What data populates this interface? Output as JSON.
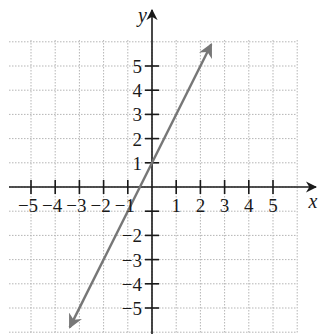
{
  "chart_data": {
    "type": "line",
    "title": "",
    "xlabel": "x",
    "ylabel": "y",
    "xlim": [
      -6,
      6
    ],
    "ylim": [
      -6,
      6
    ],
    "grid": true,
    "grid_style": "dotted",
    "x_ticks": [
      -5,
      -4,
      -3,
      -2,
      -1,
      1,
      2,
      3,
      4,
      5
    ],
    "y_ticks": [
      -5,
      -4,
      -3,
      -2,
      -1,
      1,
      2,
      3,
      4,
      5
    ],
    "x_tick_labels": [
      "−5",
      "−4",
      "−3",
      "−2",
      "−1",
      "1",
      "2",
      "3",
      "4",
      "5"
    ],
    "y_tick_labels": [
      "−5",
      "−4",
      "−3",
      "−2",
      "−1",
      "1",
      "2",
      "3",
      "4",
      "5"
    ],
    "series": [
      {
        "name": "y = 2x + 1",
        "equation": "y = 2x + 1",
        "slope": 2,
        "intercept": 1,
        "x": [
          -3.4,
          2.45
        ],
        "y": [
          -5.8,
          5.9
        ],
        "arrows": "both",
        "color": "#777777"
      }
    ],
    "legend": null
  },
  "colors": {
    "axis": "#1a1a1a",
    "grid": "#b5b5b5",
    "line": "#777777"
  }
}
